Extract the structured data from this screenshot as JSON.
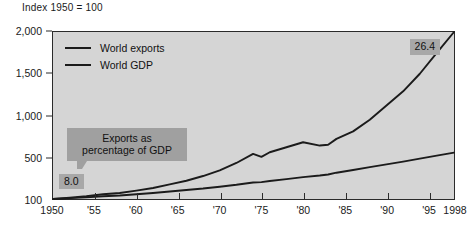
{
  "chart_data": {
    "type": "line",
    "title": "Index 1950 = 100",
    "xlabel": "",
    "ylabel": "",
    "grid": false,
    "legend_position": "top-left-inside",
    "y_axis": {
      "tick_labels": [
        "2,000",
        "1,500",
        "1,000",
        "500",
        "100"
      ],
      "tick_values": [
        2000,
        1500,
        1000,
        500,
        100
      ],
      "scale": "compressed-nonlinear",
      "ylim": [
        100,
        2000
      ]
    },
    "x_axis": {
      "tick_labels": [
        "1950",
        "'55",
        "'60",
        "'65",
        "'70",
        "'75",
        "'80",
        "'85",
        "'90",
        "'95",
        "1998"
      ],
      "tick_values": [
        1950,
        1955,
        1960,
        1965,
        1970,
        1975,
        1980,
        1985,
        1990,
        1995,
        1998
      ],
      "xlim": [
        1950,
        1998
      ]
    },
    "x": [
      1950,
      1952,
      1954,
      1956,
      1958,
      1960,
      1962,
      1964,
      1966,
      1968,
      1970,
      1972,
      1974,
      1975,
      1976,
      1978,
      1980,
      1982,
      1983,
      1984,
      1986,
      1988,
      1990,
      1992,
      1994,
      1996,
      1998
    ],
    "series": [
      {
        "name": "World exports",
        "values": [
          100,
          112,
          126,
          145,
          158,
          180,
          205,
          240,
          275,
          320,
          375,
          445,
          540,
          505,
          560,
          620,
          680,
          640,
          650,
          720,
          810,
          950,
          1120,
          1290,
          1500,
          1750,
          2000
        ]
      },
      {
        "name": "World GDP",
        "values": [
          100,
          108,
          116,
          126,
          134,
          146,
          158,
          172,
          186,
          200,
          218,
          236,
          258,
          262,
          272,
          290,
          310,
          325,
          335,
          352,
          378,
          405,
          432,
          458,
          487,
          520,
          555
        ]
      }
    ],
    "annotations": [
      {
        "name": "exports-share-callout",
        "text_line_1": "Exports as",
        "text_line_2": "percentage of GDP"
      },
      {
        "name": "start-value-badge",
        "text": "8.0",
        "value": 8.0
      },
      {
        "name": "end-value-badge",
        "text": "26.4",
        "value": 26.4
      }
    ]
  },
  "legend": {
    "items": [
      {
        "label": "World exports"
      },
      {
        "label": "World GDP"
      }
    ]
  },
  "colors": {
    "plot_background": "#d5d5d5",
    "line": "#1b1b1b",
    "badge_background": "#a8a8a8",
    "callout_background": "#a0a0a0",
    "text": "#1a1a1a"
  }
}
